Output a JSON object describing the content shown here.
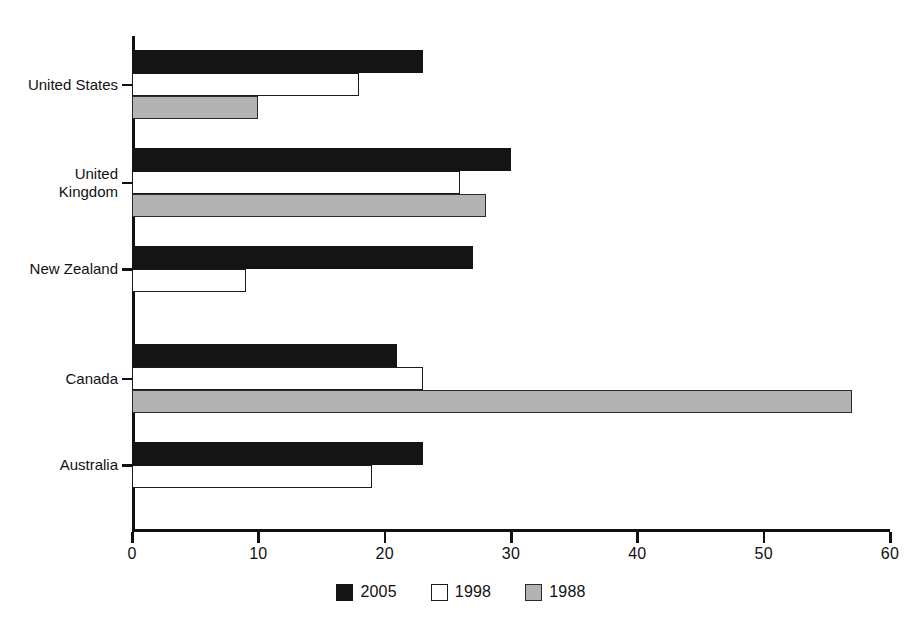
{
  "chart_data": {
    "type": "bar",
    "orientation": "horizontal",
    "title": "",
    "subtitle": "",
    "xlabel": "",
    "ylabel": "",
    "xlim": [
      0,
      60
    ],
    "xticks": [
      "0",
      "10",
      "20",
      "30",
      "40",
      "50",
      "60"
    ],
    "grid": false,
    "legend_position": "bottom-center",
    "categories": [
      "United States",
      "United Kingdom",
      "New Zealand",
      "Canada",
      "Australia"
    ],
    "series": [
      {
        "name": "2005",
        "color": "#141414",
        "values": [
          23,
          30,
          27,
          21,
          23
        ]
      },
      {
        "name": "1998",
        "color": "#ffffff",
        "values": [
          18,
          26,
          9,
          23,
          19
        ]
      },
      {
        "name": "1988",
        "color": "#b3b3b3",
        "values": [
          10,
          28,
          null,
          57,
          null
        ]
      }
    ]
  },
  "legend": {
    "items": [
      {
        "label": "2005",
        "swatch": "black-filled-square"
      },
      {
        "label": "1998",
        "swatch": "white-outline-square"
      },
      {
        "label": "1988",
        "swatch": "gray-filled-square"
      }
    ]
  },
  "axis": {
    "x_tick_labels": [
      "0",
      "10",
      "20",
      "30",
      "40",
      "50",
      "60"
    ],
    "y_tick_labels": [
      "United States",
      "United\nKingdom",
      "New Zealand",
      "Canada",
      "Australia"
    ]
  }
}
